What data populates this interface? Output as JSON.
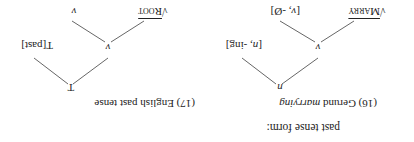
{
  "intro": "past tense form:",
  "examples": [
    {
      "number": "(16)",
      "title_plain": "Gerund",
      "title_italic": "marrying",
      "root_node": "n",
      "left_node": "v",
      "right_node_cat": "n",
      "right_node_exp": ", -ing]",
      "root_sym": "√",
      "root_name": "Marry",
      "affix_cat": "v",
      "affix_exp": ", -Ø]"
    },
    {
      "number": "(17)",
      "title_plain": "English past tense",
      "root_node": "T",
      "left_node": "v",
      "right_node": "T[past]",
      "root_sym": "√",
      "root_name": "Root",
      "affix": "v"
    }
  ]
}
